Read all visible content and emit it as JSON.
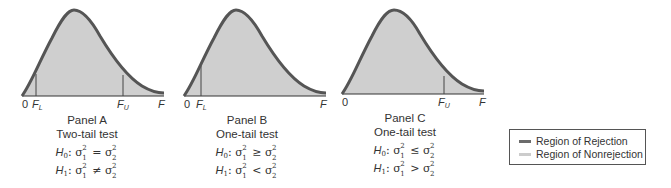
{
  "colors": {
    "curve": "#555555",
    "fill": "#cfcfcf",
    "rejection": "#6b6b6b",
    "nonrejection": "#cccccc",
    "axis": "#333333"
  },
  "panels": [
    {
      "id": "A",
      "title": "Panel A",
      "subtitle": "Two-tail test",
      "axis_labels": {
        "origin": "0",
        "lower": "F",
        "lower_sub": "L",
        "upper": "F",
        "upper_sub": "U",
        "end": "F"
      },
      "h0": {
        "label": "H",
        "sub": "0",
        "relation": "="
      },
      "h1": {
        "label": "H",
        "sub": "1",
        "relation": "≠"
      }
    },
    {
      "id": "B",
      "title": "Panel B",
      "subtitle": "One-tail test",
      "axis_labels": {
        "origin": "0",
        "lower": "F",
        "lower_sub": "L",
        "end": "F"
      },
      "h0": {
        "label": "H",
        "sub": "0",
        "relation": "≥"
      },
      "h1": {
        "label": "H",
        "sub": "1",
        "relation": "<"
      }
    },
    {
      "id": "C",
      "title": "Panel C",
      "subtitle": "One-tail test",
      "axis_labels": {
        "origin": "0",
        "upper": "F",
        "upper_sub": "U",
        "end": "F"
      },
      "h0": {
        "label": "H",
        "sub": "0",
        "relation": "≤"
      },
      "h1": {
        "label": "H",
        "sub": "1",
        "relation": ">"
      }
    }
  ],
  "sigma": {
    "symbol": "σ",
    "sup": "2",
    "sub1": "1",
    "sub2": "2"
  },
  "legend": {
    "items": [
      {
        "label": "Region of Rejection",
        "color": "#6b6b6b"
      },
      {
        "label": "Region of Nonrejection",
        "color": "#cccccc"
      }
    ]
  }
}
